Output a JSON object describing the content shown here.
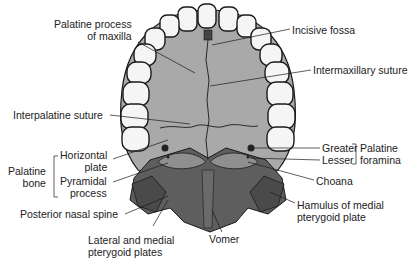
{
  "figure": {
    "colors": {
      "palate": "#a9a9a9",
      "palate_dark": "#8f8f8f",
      "bone_dark": "#5e5e5e",
      "bone_darker": "#4a4a4a",
      "tooth": "#f5f5f5",
      "outline": "#1a1a1a",
      "text": "#222222"
    },
    "labels": {
      "palatine_process": [
        "Palatine process",
        "of maxilla"
      ],
      "incisive_fossa": "Incisive fossa",
      "intermaxillary_suture": "Intermaxillary suture",
      "interpalatine_suture": "Interpalatine suture",
      "horizontal_plate": [
        "Horizontal",
        "plate"
      ],
      "pyramidal_process": [
        "Pyramidal",
        "process"
      ],
      "palatine_bone": [
        "Palatine",
        "bone"
      ],
      "posterior_nasal_spine": "Posterior nasal spine",
      "lateral_medial_pterygoid": [
        "Lateral and medial",
        "pterygoid plates"
      ],
      "vomer": "Vomer",
      "greater": "Greater",
      "lesser": "Lesser",
      "palatine_foramina": [
        "Palatine",
        "foramina"
      ],
      "choana": "Choana",
      "hamulus": [
        "Hamulus of medial",
        "pterygoid plate"
      ]
    }
  }
}
